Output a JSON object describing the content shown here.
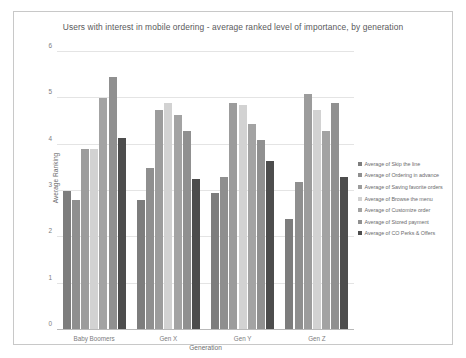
{
  "chart_data": {
    "type": "bar",
    "title": "Users with interest in mobile ordering - average ranked level of importance, by generation",
    "xlabel": "Generation",
    "ylabel": "Average Ranking",
    "ylim": [
      0,
      6
    ],
    "yticks": [
      "0",
      "1",
      "2",
      "3",
      "4",
      "5",
      "6"
    ],
    "grid": true,
    "legend_position": "right",
    "categories": [
      "Baby Boomers",
      "Gen X",
      "Gen Y",
      "Gen Z"
    ],
    "series": [
      {
        "name": "Average of Skip the line",
        "color": "#7d7d7d",
        "values": [
          3.0,
          2.8,
          2.95,
          2.4
        ]
      },
      {
        "name": "Average of Ordering in advance",
        "color": "#8f8f8f",
        "values": [
          2.8,
          3.5,
          3.3,
          3.2
        ]
      },
      {
        "name": "Average of Saving favorite orders",
        "color": "#9c9c9c",
        "values": [
          3.9,
          4.75,
          4.9,
          5.1
        ]
      },
      {
        "name": "Average of Browse the menu",
        "color": "#d2d2d2",
        "values": [
          3.9,
          4.9,
          4.85,
          4.75
        ]
      },
      {
        "name": "Average of Customize order",
        "color": "#a3a3a3",
        "values": [
          5.0,
          4.65,
          4.45,
          4.3
        ]
      },
      {
        "name": "Average of Stored payment",
        "color": "#909090",
        "values": [
          5.45,
          4.3,
          4.1,
          4.9
        ]
      },
      {
        "name": "Average of CO Perks & Offers",
        "color": "#4d4d4d",
        "values": [
          4.15,
          3.25,
          3.65,
          3.3
        ]
      }
    ]
  }
}
